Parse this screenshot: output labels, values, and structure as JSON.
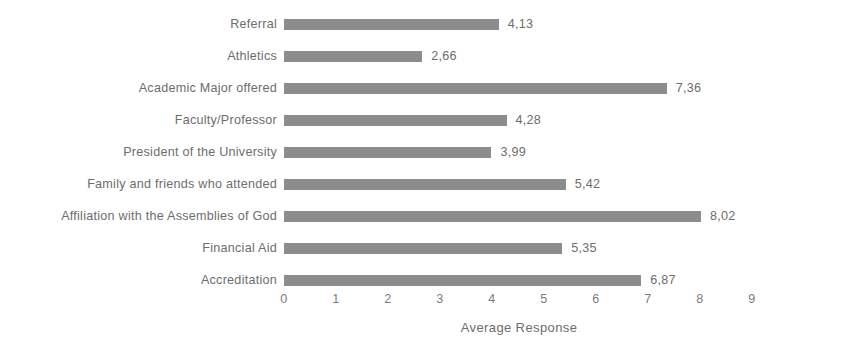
{
  "chart_data": {
    "type": "bar",
    "orientation": "horizontal",
    "title": "",
    "xlabel": "Average Response",
    "ylabel": "",
    "xlim": [
      0,
      9
    ],
    "grid": false,
    "legend": false,
    "decimal_separator": ",",
    "bar_color": "#8c8c8c",
    "text_color": "#6d6d6d",
    "background_color": "#ffffff",
    "xticks": [
      "0",
      "1",
      "2",
      "3",
      "4",
      "5",
      "6",
      "7",
      "8",
      "9"
    ],
    "categories": [
      "Referral",
      "Athletics",
      "Academic Major offered",
      "Faculty/Professor",
      "President of the University",
      "Family and friends who attended",
      "Affiliation with the Assemblies of God",
      "Financial Aid",
      "Accreditation"
    ],
    "values": [
      4.13,
      2.66,
      7.36,
      4.28,
      3.99,
      5.42,
      8.02,
      5.35,
      6.87
    ],
    "value_labels": [
      "4,13",
      "2,66",
      "7,36",
      "4,28",
      "3,99",
      "5,42",
      "8,02",
      "5,35",
      "6,87"
    ],
    "bars": [
      {
        "category": "Referral",
        "value": 4.13,
        "label": "4,13"
      },
      {
        "category": "Athletics",
        "value": 2.66,
        "label": "2,66"
      },
      {
        "category": "Academic Major offered",
        "value": 7.36,
        "label": "7,36"
      },
      {
        "category": "Faculty/Professor",
        "value": 4.28,
        "label": "4,28"
      },
      {
        "category": "President of the University",
        "value": 3.99,
        "label": "3,99"
      },
      {
        "category": "Family and friends who attended",
        "value": 5.42,
        "label": "5,42"
      },
      {
        "category": "Affiliation with the Assemblies of God",
        "value": 8.02,
        "label": "8,02"
      },
      {
        "category": "Financial Aid",
        "value": 5.35,
        "label": "5,35"
      },
      {
        "category": "Accreditation",
        "value": 6.87,
        "label": "6,87"
      }
    ]
  }
}
